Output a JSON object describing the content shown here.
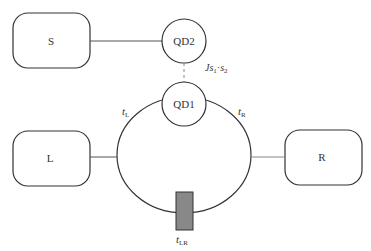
{
  "diagram": {
    "nodes": {
      "s": {
        "label": "S"
      },
      "l": {
        "label": "L"
      },
      "r": {
        "label": "R"
      },
      "qd2": {
        "label": "QD2"
      },
      "qd1": {
        "label": "QD1"
      }
    },
    "edges": {
      "t_l": {
        "symbol": "t",
        "sub": "L"
      },
      "t_r": {
        "symbol": "t",
        "sub": "R"
      },
      "t_lr": {
        "symbol": "t",
        "sub": "LR"
      },
      "coupling": {
        "prefix": "J",
        "s1": "s",
        "s1_sub": "1",
        "dot": "·",
        "s2": "s",
        "s2_sub": "2"
      }
    },
    "colors": {
      "stroke": "#333333",
      "barrier": "#888888",
      "dashed": "#999999"
    }
  }
}
